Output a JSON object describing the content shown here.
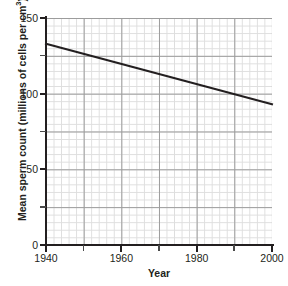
{
  "figure": {
    "clipped_header_text": "",
    "background_color": "#ffffff"
  },
  "chart_data": {
    "type": "line",
    "title": "",
    "xlabel": "Year",
    "ylabel": "Mean sperm count (millions of cells per cm³)",
    "ylabel_text": "Mean sperm count (millions of cells per cm",
    "ylabel_sup": "3",
    "ylabel_tail": ")",
    "xlim": [
      1940,
      2000
    ],
    "ylim": [
      0,
      150
    ],
    "grid": true,
    "grid_major_color": "#9c9c9c",
    "grid_minor_color": "#dedede",
    "grid_major_step_x": 10,
    "grid_major_step_y": 25,
    "grid_minor_step_x": 2,
    "grid_minor_step_y": 5,
    "legend": "none",
    "line_color": "#231f20",
    "line_width_px": 2,
    "series": [
      {
        "name": "Mean sperm count",
        "x": [
          1940,
          2000
        ],
        "values": [
          133,
          93
        ]
      }
    ],
    "x_ticks": [
      1940,
      1960,
      1980,
      2000
    ],
    "x_tick_labels": [
      "1940",
      "1960",
      "1980",
      "2000"
    ],
    "x_minor_ticks": [
      1950,
      1970,
      1990
    ],
    "y_ticks": [
      0,
      50,
      100,
      150
    ],
    "y_tick_labels": [
      "0",
      "50",
      "100",
      "150"
    ],
    "y_minor_ticks": [
      25,
      75,
      125
    ]
  }
}
